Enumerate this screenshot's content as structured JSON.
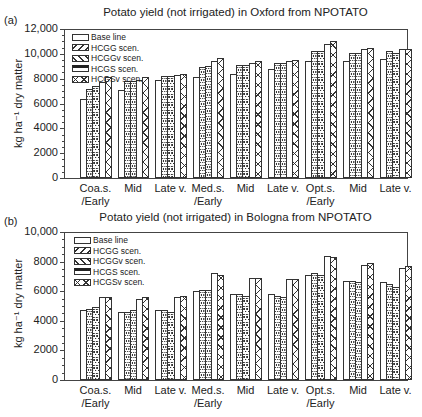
{
  "legend": {
    "items": [
      {
        "label": "Base line",
        "pattern": "base"
      },
      {
        "label": "HCGG scen.",
        "pattern": "hcgg"
      },
      {
        "label": "HCGGv scen.",
        "pattern": "hcggv"
      },
      {
        "label": "HCGS scen.",
        "pattern": "hcgs"
      },
      {
        "label": "HCGSv scen.",
        "pattern": "hcgsv"
      }
    ]
  },
  "panels": [
    {
      "label": "(a)",
      "title": "Potato yield (not irrigated) in Oxford from NPOTATO",
      "ylabel": "kg ha⁻¹ dry matter",
      "yticks": [
        "12,000",
        "10,000",
        "8000",
        "6000",
        "4000",
        "2000",
        "0"
      ]
    },
    {
      "label": "(b)",
      "title": "Potato yield (not irrigated) in Bologna from NPOTATO",
      "ylabel": "kg ha⁻¹ dry matter",
      "yticks": [
        "10,000",
        "8000",
        "6000",
        "4000",
        "2000",
        "0"
      ]
    }
  ],
  "xlabels": [
    [
      "Coa.s.",
      "/Early"
    ],
    [
      "Mid",
      ""
    ],
    [
      "Late v.",
      ""
    ],
    [
      "Med.s.",
      "/Early"
    ],
    [
      "Mid",
      ""
    ],
    [
      "Late v.",
      ""
    ],
    [
      "Opt.s.",
      "/Early"
    ],
    [
      "Mid",
      ""
    ],
    [
      "Late v.",
      ""
    ]
  ],
  "chart_data": [
    {
      "type": "bar",
      "title": "Potato yield (not irrigated) in Oxford from NPOTATO",
      "panel": "(a)",
      "xlabel": "",
      "ylabel": "kg ha-1 dry matter",
      "ylim": [
        0,
        12000
      ],
      "yticks": [
        0,
        2000,
        4000,
        6000,
        8000,
        10000,
        12000
      ],
      "categories": [
        "Coa.s./Early",
        "Mid",
        "Late v.",
        "Med.s./Early",
        "Mid",
        "Late v.",
        "Opt.s./Early",
        "Mid",
        "Late v."
      ],
      "legend_position": "upper left",
      "grid": false,
      "series": [
        {
          "name": "Base line",
          "values": [
            6400,
            7100,
            7900,
            8100,
            8400,
            8800,
            9400,
            9400,
            9600
          ]
        },
        {
          "name": "HCGG scen.",
          "values": [
            7200,
            7800,
            8200,
            8900,
            9100,
            9300,
            10200,
            10100,
            10200
          ]
        },
        {
          "name": "HCGGv scen.",
          "values": [
            7400,
            7800,
            8200,
            9000,
            9100,
            9300,
            10200,
            10100,
            10100
          ]
        },
        {
          "name": "HCGS scen.",
          "values": [
            7700,
            7900,
            8300,
            9400,
            9300,
            9400,
            10800,
            10400,
            10400
          ]
        },
        {
          "name": "HCGSv scen.",
          "values": [
            8100,
            8100,
            8400,
            9700,
            9400,
            9500,
            11000,
            10500,
            10400
          ]
        }
      ]
    },
    {
      "type": "bar",
      "title": "Potato yield (not irrigated) in Bologna from NPOTATO",
      "panel": "(b)",
      "xlabel": "",
      "ylabel": "kg ha-1 dry matter",
      "ylim": [
        0,
        10000
      ],
      "yticks": [
        0,
        2000,
        4000,
        6000,
        8000,
        10000
      ],
      "categories": [
        "Coa.s./Early",
        "Mid",
        "Late v.",
        "Med.s./Early",
        "Mid",
        "Late v.",
        "Opt.s./Early",
        "Mid",
        "Late v."
      ],
      "legend_position": "upper left",
      "grid": false,
      "series": [
        {
          "name": "Base line",
          "values": [
            4700,
            4600,
            4700,
            6000,
            5800,
            5800,
            7100,
            6700,
            6600
          ]
        },
        {
          "name": "HCGG scen.",
          "values": [
            4800,
            4600,
            4700,
            6100,
            5800,
            5700,
            7200,
            6700,
            6500
          ]
        },
        {
          "name": "HCGGv scen.",
          "values": [
            4900,
            4700,
            4600,
            6100,
            5700,
            5600,
            7100,
            6600,
            6300
          ]
        },
        {
          "name": "HCGS scen.",
          "values": [
            5600,
            5500,
            5600,
            7200,
            6900,
            6800,
            8400,
            7800,
            7600
          ]
        },
        {
          "name": "HCGSv scen.",
          "values": [
            5600,
            5600,
            5700,
            7100,
            6900,
            6800,
            8300,
            7900,
            7700
          ]
        }
      ]
    }
  ]
}
